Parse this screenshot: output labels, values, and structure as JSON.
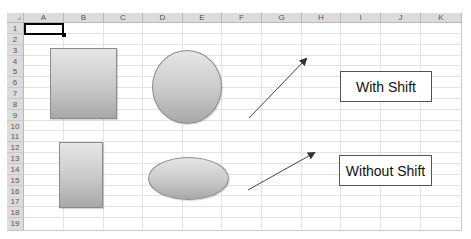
{
  "spreadsheet": {
    "columns": [
      "A",
      "B",
      "C",
      "D",
      "E",
      "F",
      "G",
      "H",
      "I",
      "J",
      "K"
    ],
    "rows": [
      "1",
      "2",
      "3",
      "4",
      "5",
      "6",
      "7",
      "8",
      "9",
      "10",
      "11",
      "12",
      "13",
      "14",
      "15",
      "16",
      "17",
      "18",
      "19"
    ],
    "selected_cell": "A1"
  },
  "shapes": {
    "square": {
      "type": "rectangle",
      "label": "square-with-shift"
    },
    "circle": {
      "type": "ellipse",
      "label": "circle-with-shift"
    },
    "rectangle": {
      "type": "rectangle",
      "label": "rectangle-without-shift"
    },
    "ellipse": {
      "type": "ellipse",
      "label": "ellipse-without-shift"
    },
    "arrow_with_shift": {
      "type": "arrow",
      "label": "45-degree-arrow"
    },
    "arrow_without_shift": {
      "type": "arrow",
      "label": "free-angle-arrow"
    }
  },
  "labels": {
    "with_shift": "With Shift",
    "without_shift": "Without Shift"
  },
  "colors": {
    "header_bg": "#dcdcdc",
    "gridline": "#e3e3e3",
    "shape_fill_top": "#e6e6e6",
    "shape_fill_bottom": "#a8a8a8",
    "shape_border": "#8a8a8a",
    "arrow": "#333333"
  }
}
